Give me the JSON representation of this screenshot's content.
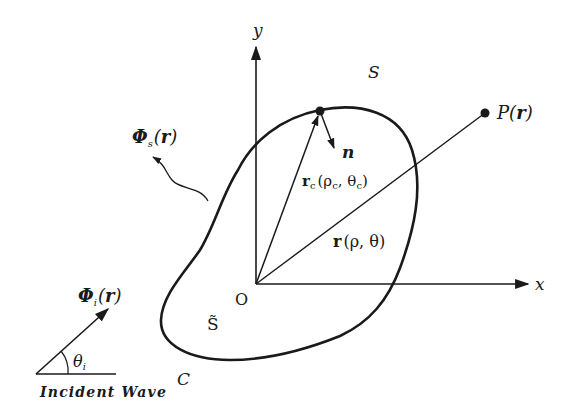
{
  "diagram": {
    "type": "scattering-geometry",
    "axes": {
      "x_label": "x",
      "y_label": "y",
      "origin_label": "O"
    },
    "regions": {
      "exterior_label": "S",
      "interior_label": "S̃",
      "contour_label": "C"
    },
    "vectors": {
      "boundary_position": {
        "symbol": "r",
        "sub": "c",
        "args": "(ρ",
        "args_sub": "c",
        "comma": ", θ",
        "args2_sub": "c",
        "close": ")"
      },
      "field_position": {
        "symbol": "r",
        "args": "(ρ, θ)"
      },
      "normal": "n"
    },
    "points": {
      "observation": {
        "symbol": "P(",
        "arg": "r",
        "close": ")"
      }
    },
    "fields": {
      "scattered": {
        "symbol": "Φ",
        "sub": "s",
        "open": "(",
        "arg": "r",
        "close": ")"
      },
      "incident": {
        "symbol": "Φ",
        "sub": "i",
        "open": "(",
        "arg": "r",
        "close": ")"
      }
    },
    "incident_wave": {
      "angle_symbol": "θ",
      "angle_sub": "i",
      "caption": "Incident Wave"
    },
    "colors": {
      "ink": "#1a1a1a",
      "background": "#ffffff"
    }
  }
}
